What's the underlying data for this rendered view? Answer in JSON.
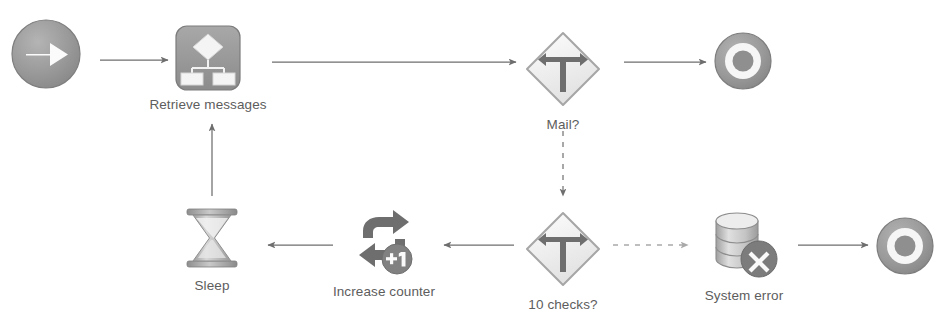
{
  "diagram": {
    "type": "flowchart",
    "background_color": "#ffffff",
    "label_color": "#5d5d5d",
    "icon_color": "#8c8c8c",
    "edge_color": "#6e6e6e",
    "edge_color_light": "#b0b0b0",
    "nodes": [
      {
        "id": "start",
        "label": "",
        "icon": "start-circle-arrow-icon",
        "x": 8,
        "y": 16,
        "size": 76
      },
      {
        "id": "retrieve-messages",
        "label": "Retrieve messages",
        "icon": "hierarchy-process-icon",
        "x": 174,
        "y": 24,
        "size": 68
      },
      {
        "id": "mail-decision",
        "label": "Mail?",
        "icon": "decision-fork-sign-icon",
        "x": 520,
        "y": 26,
        "size": 66
      },
      {
        "id": "end-success",
        "label": "",
        "icon": "end-bullseye-icon",
        "x": 712,
        "y": 30,
        "size": 60
      },
      {
        "id": "sleep",
        "label": "Sleep",
        "icon": "hourglass-icon",
        "x": 179,
        "y": 203,
        "size": 66
      },
      {
        "id": "increase-counter",
        "label": "Increase counter",
        "icon": "loop-plus-one-icon",
        "x": 341,
        "y": 205,
        "size": 66
      },
      {
        "id": "ten-checks-decision",
        "label": "10 checks?",
        "icon": "decision-fork-sign-icon",
        "x": 519,
        "y": 206,
        "size": 66
      },
      {
        "id": "system-error",
        "label": "System error",
        "icon": "database-error-icon",
        "x": 694,
        "y": 207,
        "size": 70
      },
      {
        "id": "end-error",
        "label": "",
        "icon": "end-bullseye-icon",
        "x": 874,
        "y": 215,
        "size": 60
      }
    ],
    "edges": [
      {
        "id": "start-to-retrieve",
        "from": "start",
        "to": "retrieve-messages",
        "style": "solid",
        "direction": "right"
      },
      {
        "id": "retrieve-to-mail",
        "from": "retrieve-messages",
        "to": "mail-decision",
        "style": "solid",
        "direction": "right"
      },
      {
        "id": "mail-to-end",
        "from": "mail-decision",
        "to": "end-success",
        "style": "solid",
        "direction": "right"
      },
      {
        "id": "mail-to-ten-checks",
        "from": "mail-decision",
        "to": "ten-checks-decision",
        "style": "dashed",
        "direction": "down"
      },
      {
        "id": "ten-checks-to-increase",
        "from": "ten-checks-decision",
        "to": "increase-counter",
        "style": "solid",
        "direction": "left"
      },
      {
        "id": "increase-to-sleep",
        "from": "increase-counter",
        "to": "sleep",
        "style": "solid",
        "direction": "left"
      },
      {
        "id": "sleep-to-retrieve",
        "from": "sleep",
        "to": "retrieve-messages",
        "style": "solid",
        "direction": "up"
      },
      {
        "id": "ten-checks-to-system-error",
        "from": "ten-checks-decision",
        "to": "system-error",
        "style": "dashed",
        "direction": "right"
      },
      {
        "id": "system-error-to-end",
        "from": "system-error",
        "to": "end-error",
        "style": "solid",
        "direction": "right"
      }
    ]
  }
}
